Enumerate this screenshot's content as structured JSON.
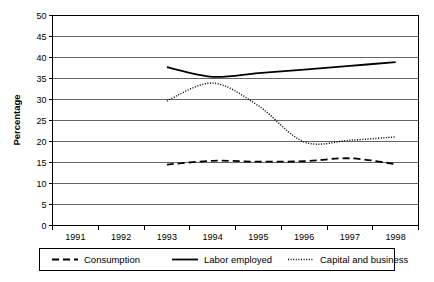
{
  "chart_data": {
    "type": "line",
    "title": "",
    "xlabel": "",
    "ylabel": "Percentage",
    "x": [
      1991,
      1992,
      1993,
      1994,
      1995,
      1996,
      1997,
      1998
    ],
    "xticklabels": [
      "1991",
      "1992",
      "1993",
      "1994",
      "1995",
      "1996",
      "1997",
      "1998"
    ],
    "xlim": [
      1990.5,
      1998.5
    ],
    "ylim": [
      0,
      50
    ],
    "yticks": [
      0,
      5,
      10,
      15,
      20,
      25,
      30,
      35,
      40,
      45,
      50
    ],
    "yticklabels": [
      "0",
      "5",
      "10",
      "15",
      "20",
      "25",
      "30",
      "35",
      "40",
      "45",
      "50"
    ],
    "grid": true,
    "grid_axis": "y",
    "legend_position": "bottom",
    "series": [
      {
        "name": "Consumption",
        "style": "dashed",
        "color": "#000000",
        "x": [
          1993,
          1994,
          1995,
          1996,
          1997,
          1998
        ],
        "values": [
          14.5,
          15.4,
          15.2,
          15.3,
          16.0,
          14.6
        ]
      },
      {
        "name": "Labor employed",
        "style": "solid",
        "color": "#000000",
        "x": [
          1993,
          1994,
          1995,
          1996,
          1997,
          1998
        ],
        "values": [
          37.7,
          35.4,
          36.3,
          37.1,
          38.0,
          38.9
        ]
      },
      {
        "name": "Capital and business",
        "style": "dotted",
        "color": "#000000",
        "x": [
          1993,
          1994,
          1995,
          1996,
          1997,
          1998
        ],
        "values": [
          29.7,
          33.9,
          28.5,
          19.9,
          20.3,
          21.1
        ]
      }
    ]
  },
  "legend": {
    "items": [
      {
        "label": "Consumption",
        "style": "dashed"
      },
      {
        "label": "Labor employed",
        "style": "solid"
      },
      {
        "label": "Capital and business",
        "style": "dotted"
      }
    ]
  }
}
